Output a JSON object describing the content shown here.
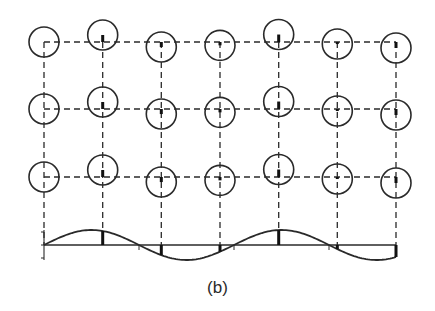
{
  "figure": {
    "caption": "(b)",
    "colors": {
      "stroke": "#2a2a2a",
      "background": "#ffffff"
    },
    "grid": {
      "columns_x": [
        44,
        102.7,
        161.3,
        220,
        278.7,
        337.3,
        396
      ],
      "rows_y": [
        42,
        109,
        177
      ],
      "dash": "6,4",
      "line_style": "dashed"
    },
    "atoms": {
      "radius": 15,
      "displacement_scale": -0.5,
      "marker": "small filled bar at lattice point indicating displacement"
    },
    "wave": {
      "baseline_y": 245,
      "x_start": 44,
      "x_end": 396,
      "amplitude": 15,
      "period": 190,
      "phase_zero_x": 44,
      "zero_crossing_ticks_x": [
        139,
        234,
        329
      ],
      "axis_ticks_y": [
        232,
        245,
        258
      ]
    },
    "displacement_bars": {
      "width": 3
    }
  }
}
